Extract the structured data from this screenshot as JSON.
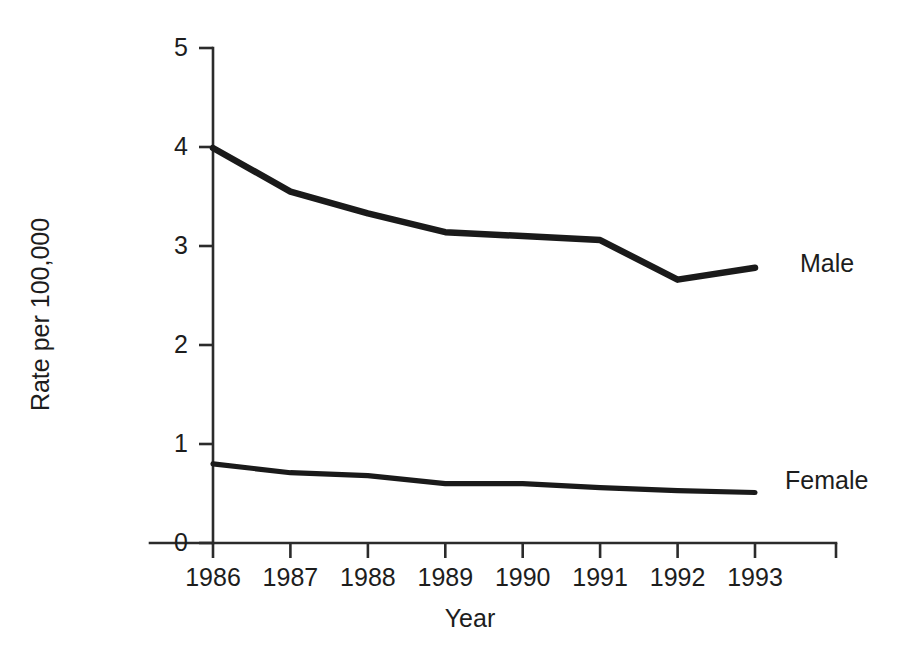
{
  "chart_data": {
    "type": "line",
    "title": "",
    "subtitle": "",
    "xlabel": "Year",
    "ylabel": "Rate per 100,000",
    "categories": [
      "1986",
      "1987",
      "1988",
      "1989",
      "1990",
      "1991",
      "1992",
      "1993"
    ],
    "x": [
      1986,
      1987,
      1988,
      1989,
      1990,
      1991,
      1992,
      1993
    ],
    "xlim": [
      1986,
      1993
    ],
    "ylim": [
      0,
      5
    ],
    "yticks": [
      "0",
      "1",
      "2",
      "3",
      "4",
      "5"
    ],
    "ytick_values": [
      0,
      1,
      2,
      3,
      4,
      5
    ],
    "xticks": [
      "1986",
      "1987",
      "1988",
      "1989",
      "1990",
      "1991",
      "1992",
      "1993"
    ],
    "grid": false,
    "legend_position": "inline-right",
    "series": [
      {
        "name": "Male",
        "label": "Male",
        "color": "#1a1a1a",
        "values": [
          3.99,
          3.55,
          3.33,
          3.14,
          3.1,
          3.06,
          2.66,
          2.78
        ]
      },
      {
        "name": "Female",
        "label": "Female",
        "color": "#1a1a1a",
        "values": [
          0.8,
          0.71,
          0.68,
          0.6,
          0.6,
          0.56,
          0.53,
          0.51
        ]
      }
    ],
    "annotations": []
  },
  "axes": {
    "y_title": "Rate per 100,000",
    "x_title": "Year",
    "y_tick_labels": [
      "5",
      "4",
      "3",
      "2",
      "1",
      "0"
    ],
    "x_tick_labels": [
      "1986",
      "1987",
      "1988",
      "1989",
      "1990",
      "1991",
      "1992",
      "1993"
    ]
  },
  "labels": {
    "male": "Male",
    "female": "Female"
  },
  "colors": {
    "line": "#1a1a1a",
    "axis": "#2b2b2b",
    "background": "#ffffff",
    "text": "#1d1d1d"
  }
}
